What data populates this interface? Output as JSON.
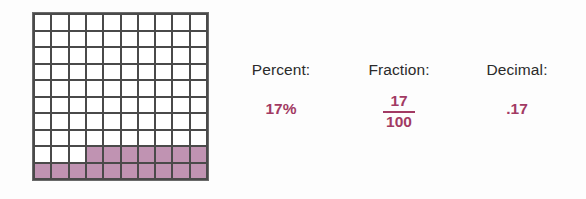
{
  "model": {
    "type": "hundred-grid",
    "rows": 10,
    "columns": 10,
    "total_cells": 100,
    "shaded_count": 17,
    "unshaded_count": 83,
    "shaded_color": "#c093b2",
    "gridline_color": "#4a4a4a",
    "cell_color": "#ffffff",
    "shaded_cells_by_row": [
      {
        "row": 10,
        "shaded_columns": [
          1,
          2,
          3,
          4,
          5,
          6,
          7,
          8,
          9,
          10
        ]
      },
      {
        "row": 9,
        "shaded_columns": [
          4,
          5,
          6,
          7,
          8,
          9,
          10
        ]
      }
    ]
  },
  "columns": [
    {
      "key": "percent",
      "header": "Percent:",
      "value": "17%",
      "value_kind": "plain"
    },
    {
      "key": "fraction",
      "header": "Fraction:",
      "value_kind": "fraction",
      "numerator": "17",
      "denominator": "100"
    },
    {
      "key": "decimal",
      "header": "Decimal:",
      "value": ".17",
      "value_kind": "plain"
    }
  ],
  "colors": {
    "value_text": "#a23a63",
    "header_text": "#2b2b2b",
    "background": "#fdfdfd"
  }
}
